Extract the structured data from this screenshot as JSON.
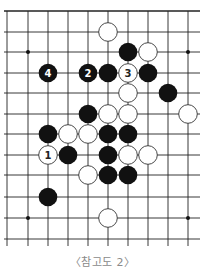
{
  "diagram": {
    "caption": "〈참고도 2〉",
    "grid": {
      "columns_x": [
        7,
        28,
        48,
        68,
        88,
        108,
        128,
        148,
        168,
        188
      ],
      "rows_y": [
        11,
        32,
        52,
        73,
        93,
        114,
        134,
        155,
        175,
        197,
        218,
        239
      ],
      "x_start": 4,
      "x_end": 200,
      "y_start": 11,
      "y_end": 246,
      "line_color": "#222222",
      "stone_radius": 9.3
    },
    "star_points": [
      {
        "col": 1,
        "row": 2
      },
      {
        "col": 9,
        "row": 2
      },
      {
        "col": 1,
        "row": 10
      },
      {
        "col": 9,
        "row": 10
      }
    ],
    "stones": [
      {
        "col": 5,
        "row": 1,
        "color": "white",
        "label": ""
      },
      {
        "col": 6,
        "row": 2,
        "color": "black",
        "label": ""
      },
      {
        "col": 7,
        "row": 2,
        "color": "white",
        "label": ""
      },
      {
        "col": 2,
        "row": 3,
        "color": "black",
        "label": "4"
      },
      {
        "col": 4,
        "row": 3,
        "color": "black",
        "label": "2"
      },
      {
        "col": 5,
        "row": 3,
        "color": "black",
        "label": ""
      },
      {
        "col": 6,
        "row": 3,
        "color": "white",
        "label": "3"
      },
      {
        "col": 7,
        "row": 3,
        "color": "black",
        "label": ""
      },
      {
        "col": 6,
        "row": 4,
        "color": "white",
        "label": ""
      },
      {
        "col": 8,
        "row": 4,
        "color": "black",
        "label": ""
      },
      {
        "col": 4,
        "row": 5,
        "color": "black",
        "label": ""
      },
      {
        "col": 5,
        "row": 5,
        "color": "white",
        "label": ""
      },
      {
        "col": 6,
        "row": 5,
        "color": "white",
        "label": ""
      },
      {
        "col": 9,
        "row": 5,
        "color": "white",
        "label": ""
      },
      {
        "col": 2,
        "row": 6,
        "color": "black",
        "label": ""
      },
      {
        "col": 3,
        "row": 6,
        "color": "white",
        "label": ""
      },
      {
        "col": 4,
        "row": 6,
        "color": "white",
        "label": ""
      },
      {
        "col": 5,
        "row": 6,
        "color": "black",
        "label": ""
      },
      {
        "col": 6,
        "row": 6,
        "color": "black",
        "label": ""
      },
      {
        "col": 2,
        "row": 7,
        "color": "white",
        "label": "1"
      },
      {
        "col": 3,
        "row": 7,
        "color": "black",
        "label": ""
      },
      {
        "col": 5,
        "row": 7,
        "color": "black",
        "label": ""
      },
      {
        "col": 6,
        "row": 7,
        "color": "white",
        "label": ""
      },
      {
        "col": 7,
        "row": 7,
        "color": "white",
        "label": ""
      },
      {
        "col": 4,
        "row": 8,
        "color": "white",
        "label": ""
      },
      {
        "col": 5,
        "row": 8,
        "color": "black",
        "label": ""
      },
      {
        "col": 6,
        "row": 8,
        "color": "black",
        "label": ""
      },
      {
        "col": 2,
        "row": 9,
        "color": "black",
        "label": ""
      },
      {
        "col": 5,
        "row": 10,
        "color": "white",
        "label": ""
      }
    ],
    "colors": {
      "black_stone": "#111111",
      "white_stone": "#ffffff",
      "white_stone_border": "#333333",
      "black_label": "#ffffff",
      "white_label": "#222222"
    }
  }
}
